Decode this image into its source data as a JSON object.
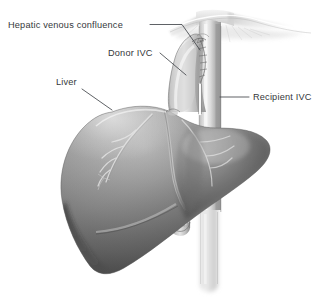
{
  "figure": {
    "width": 333,
    "height": 301,
    "background_color": "#ffffff",
    "style": "grayscale medical line-and-tone illustration"
  },
  "labels": [
    {
      "id": "hepatic-venous-confluence",
      "text": "Hepatic venous confluence",
      "x": 8,
      "y": 28,
      "anchor": "start",
      "leader": "M 150 24.5 L 182 24.5 L 200 50",
      "points_to": "junction of hepatic veins with the donor IVC cuff at the diaphragm"
    },
    {
      "id": "donor-ivc",
      "text": "Donor IVC",
      "x": 108,
      "y": 56,
      "anchor": "start",
      "leader": "M 160 53 L 186 75",
      "points_to": "curved donor inferior vena cava segment attached to the graft liver"
    },
    {
      "id": "liver",
      "text": "Liver",
      "x": 56,
      "y": 85,
      "anchor": "start",
      "leader": "M 82 89 L 112 110",
      "points_to": "dome of the transplanted liver graft"
    },
    {
      "id": "recipient-ivc",
      "text": "Recipient IVC",
      "x": 253,
      "y": 100,
      "anchor": "start",
      "leader": "M 220 97 L 249 97",
      "points_to": "vertical recipient inferior vena cava trunk"
    }
  ],
  "anatomy": {
    "structures": [
      {
        "id": "diaphragm",
        "name": "Diaphragm",
        "tone": "very light gray"
      },
      {
        "id": "recipient-ivc-vessel",
        "name": "Recipient IVC",
        "tone": "light gray cylinder"
      },
      {
        "id": "donor-ivc-vessel",
        "name": "Donor IVC cuff",
        "tone": "light-mid gray cylinder"
      },
      {
        "id": "anastomosis-suture",
        "name": "Anastomotic suture line",
        "tone": "dark stitch line"
      },
      {
        "id": "liver-graft",
        "name": "Liver graft",
        "tone": "mid gray with dark inferior shading"
      },
      {
        "id": "liver-vessels",
        "name": "Surface hepatic vessels",
        "tone": "pale highlight lines"
      },
      {
        "id": "infrahepatic-stump",
        "name": "Infrahepatic donor IVC stump",
        "tone": "light gray with suture ring"
      }
    ]
  },
  "colors": {
    "background": "#ffffff",
    "label_text": "#35383b",
    "leader_line": "#42464a",
    "liver_light": "#c9c9c9",
    "liver_mid": "#9a9a9a",
    "liver_dark": "#4a4a4a",
    "liver_shadow": "#3a3a3a",
    "vessel_light": "#e3e3e3",
    "vessel_mid": "#b8b8b8",
    "vessel_dark": "#8d8d8d",
    "diaphragm": "#efefef",
    "suture": "#5a5a5a",
    "highlight": "#f2f2f2"
  }
}
